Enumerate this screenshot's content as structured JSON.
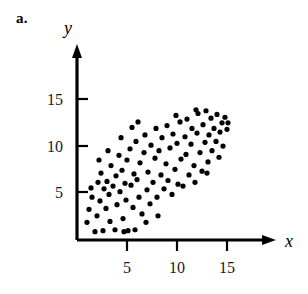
{
  "figure": {
    "part_label": "a."
  },
  "chart_data": {
    "type": "scatter",
    "title": "",
    "subtitle": "",
    "xlabel": "x",
    "ylabel": "y",
    "xlim": [
      0,
      17.5
    ],
    "ylim": [
      0,
      18
    ],
    "xticks": [
      5,
      10,
      15
    ],
    "yticks": [
      5,
      10,
      15
    ],
    "xtick_labels": [
      "5",
      "10",
      "15"
    ],
    "ytick_labels": [
      "5",
      "10",
      "15"
    ],
    "grid": false,
    "legend": null,
    "axis_arrows": true,
    "point_color": "#000000",
    "point_radius": 2.6,
    "annotations": [],
    "series": [
      {
        "name": "observations",
        "points": [
          [
            1.0,
            1.9
          ],
          [
            1.2,
            3.3
          ],
          [
            1.4,
            5.6
          ],
          [
            1.5,
            4.6
          ],
          [
            1.8,
            0.9
          ],
          [
            2.0,
            2.6
          ],
          [
            2.1,
            6.2
          ],
          [
            2.3,
            4.2
          ],
          [
            2.4,
            7.2
          ],
          [
            2.6,
            1.0
          ],
          [
            2.7,
            5.5
          ],
          [
            2.9,
            3.4
          ],
          [
            3.0,
            6.3
          ],
          [
            3.2,
            4.9
          ],
          [
            3.3,
            2.0
          ],
          [
            3.4,
            8.0
          ],
          [
            3.6,
            5.8
          ],
          [
            3.8,
            1.1
          ],
          [
            3.9,
            6.9
          ],
          [
            4.0,
            3.8
          ],
          [
            4.2,
            9.1
          ],
          [
            4.3,
            5.2
          ],
          [
            4.5,
            7.5
          ],
          [
            4.6,
            2.3
          ],
          [
            4.8,
            6.1
          ],
          [
            4.9,
            4.3
          ],
          [
            5.0,
            8.6
          ],
          [
            5.1,
            1.0
          ],
          [
            5.3,
            9.8
          ],
          [
            5.4,
            5.9
          ],
          [
            5.6,
            3.5
          ],
          [
            5.7,
            7.1
          ],
          [
            5.9,
            10.6
          ],
          [
            6.0,
            6.5
          ],
          [
            6.2,
            4.6
          ],
          [
            6.3,
            8.3
          ],
          [
            6.5,
            2.8
          ],
          [
            6.7,
            9.4
          ],
          [
            6.8,
            11.3
          ],
          [
            7.0,
            5.4
          ],
          [
            7.1,
            7.3
          ],
          [
            7.3,
            3.9
          ],
          [
            7.4,
            10.2
          ],
          [
            7.6,
            6.2
          ],
          [
            7.8,
            8.8
          ],
          [
            7.9,
            12.0
          ],
          [
            8.0,
            4.6
          ],
          [
            8.2,
            9.6
          ],
          [
            8.4,
            7.0
          ],
          [
            8.5,
            11.0
          ],
          [
            8.7,
            5.5
          ],
          [
            8.9,
            8.2
          ],
          [
            9.0,
            12.3
          ],
          [
            9.1,
            6.4
          ],
          [
            9.3,
            9.9
          ],
          [
            9.5,
            4.9
          ],
          [
            9.6,
            11.4
          ],
          [
            9.8,
            7.6
          ],
          [
            10.0,
            10.4
          ],
          [
            10.1,
            6.0
          ],
          [
            10.3,
            12.7
          ],
          [
            10.4,
            8.7
          ],
          [
            10.6,
            5.8
          ],
          [
            10.8,
            11.1
          ],
          [
            10.9,
            9.2
          ],
          [
            11.0,
            13.0
          ],
          [
            11.2,
            7.0
          ],
          [
            11.4,
            10.3
          ],
          [
            11.5,
            12.0
          ],
          [
            11.7,
            8.0
          ],
          [
            11.8,
            6.2
          ],
          [
            12.0,
            11.5
          ],
          [
            12.1,
            13.6
          ],
          [
            12.3,
            9.4
          ],
          [
            12.5,
            7.4
          ],
          [
            12.6,
            12.4
          ],
          [
            12.8,
            10.5
          ],
          [
            12.9,
            13.9
          ],
          [
            13.1,
            8.4
          ],
          [
            13.2,
            11.3
          ],
          [
            13.4,
            13.1
          ],
          [
            13.5,
            9.6
          ],
          [
            13.7,
            12.0
          ],
          [
            13.9,
            10.6
          ],
          [
            14.0,
            13.5
          ],
          [
            14.2,
            8.9
          ],
          [
            14.3,
            11.6
          ],
          [
            14.5,
            12.6
          ],
          [
            14.6,
            10.1
          ],
          [
            14.8,
            13.2
          ],
          [
            15.0,
            11.9
          ],
          [
            15.1,
            12.6
          ],
          [
            2.2,
            8.6
          ],
          [
            3.1,
            9.6
          ],
          [
            4.4,
            11.0
          ],
          [
            5.5,
            12.1
          ],
          [
            6.1,
            12.7
          ],
          [
            9.9,
            13.4
          ],
          [
            11.9,
            14.0
          ],
          [
            13.0,
            7.2
          ],
          [
            8.1,
            2.6
          ],
          [
            6.9,
            1.9
          ],
          [
            5.8,
            1.1
          ],
          [
            4.7,
            0.9
          ]
        ]
      }
    ]
  }
}
